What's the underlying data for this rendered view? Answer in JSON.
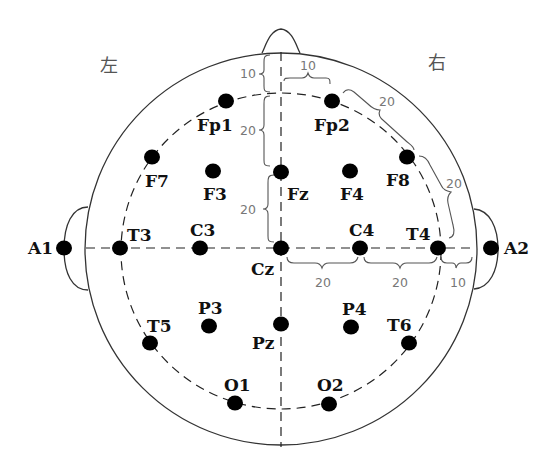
{
  "diagram": {
    "side_labels": {
      "left": "左",
      "right": "右"
    },
    "colors": {
      "outline": "#333333",
      "electrode": "#000000",
      "distance_text": "#777777"
    },
    "electrodes": [
      {
        "id": "Fp1",
        "label": "Fp1"
      },
      {
        "id": "Fp2",
        "label": "Fp2"
      },
      {
        "id": "F7",
        "label": "F7"
      },
      {
        "id": "F3",
        "label": "F3"
      },
      {
        "id": "Fz",
        "label": "Fz"
      },
      {
        "id": "F4",
        "label": "F4"
      },
      {
        "id": "F8",
        "label": "F8"
      },
      {
        "id": "A1",
        "label": "A1"
      },
      {
        "id": "T3",
        "label": "T3"
      },
      {
        "id": "C3",
        "label": "C3"
      },
      {
        "id": "Cz",
        "label": "Cz"
      },
      {
        "id": "C4",
        "label": "C4"
      },
      {
        "id": "T4",
        "label": "T4"
      },
      {
        "id": "A2",
        "label": "A2"
      },
      {
        "id": "T5",
        "label": "T5"
      },
      {
        "id": "P3",
        "label": "P3"
      },
      {
        "id": "Pz",
        "label": "Pz"
      },
      {
        "id": "P4",
        "label": "P4"
      },
      {
        "id": "T6",
        "label": "T6"
      },
      {
        "id": "O1",
        "label": "O1"
      },
      {
        "id": "O2",
        "label": "O2"
      }
    ],
    "distances": [
      {
        "id": "nasion-fp",
        "value": "10"
      },
      {
        "id": "fp-fz",
        "value": "20"
      },
      {
        "id": "fz-cz",
        "value": "20"
      },
      {
        "id": "midline-fp2",
        "value": "10"
      },
      {
        "id": "fp2-f8",
        "value": "20"
      },
      {
        "id": "f8-t4",
        "value": "20"
      },
      {
        "id": "cz-c4",
        "value": "20"
      },
      {
        "id": "c4-t4",
        "value": "20"
      },
      {
        "id": "t4-a2",
        "value": "10"
      }
    ]
  }
}
